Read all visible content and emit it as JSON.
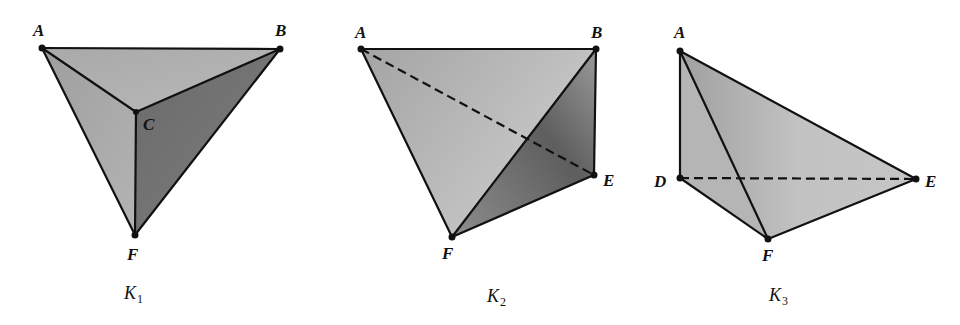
{
  "figures": [
    {
      "id": "K1",
      "caption": "K",
      "caption_sub": "1",
      "vertices": {
        "A": "A",
        "B": "B",
        "C": "C",
        "F": "F"
      },
      "edges_solid": [
        "AB",
        "AC",
        "BC",
        "AF",
        "BF",
        "CF"
      ],
      "edges_dashed": []
    },
    {
      "id": "K2",
      "caption": "K",
      "caption_sub": "2",
      "vertices": {
        "A": "A",
        "B": "B",
        "E": "E",
        "F": "F"
      },
      "edges_solid": [
        "AB",
        "BE",
        "AF",
        "BF",
        "EF"
      ],
      "edges_dashed": [
        "AE"
      ]
    },
    {
      "id": "K3",
      "caption": "K",
      "caption_sub": "3",
      "vertices": {
        "A": "A",
        "D": "D",
        "E": "E",
        "F": "F"
      },
      "edges_solid": [
        "AD",
        "AE",
        "AF",
        "DF",
        "EF"
      ],
      "edges_dashed": [
        "DE"
      ]
    }
  ],
  "colors": {
    "face_light": "#b8b8b8",
    "face_mid": "#9a9a9a",
    "face_dark": "#6e6e6e",
    "edge": "#111111"
  }
}
